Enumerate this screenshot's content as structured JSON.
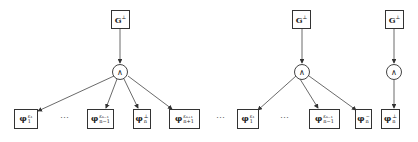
{
  "diagrams": [
    {
      "root": {
        "base": "G",
        "sup": "⊥"
      },
      "op": "∧",
      "children": [
        {
          "base": "φ",
          "sub": "1",
          "sup": "ε₁"
        },
        {
          "ellipsis": "⋯"
        },
        {
          "base": "φ",
          "sub": "n−1",
          "sup": "ε_{n−1}"
        },
        {
          "base": "φ",
          "sub": "n",
          "sup": "⊥"
        },
        {
          "base": "φ",
          "sub": "n+1",
          "sup": "ε_{n+1}"
        }
      ]
    },
    {
      "root": {
        "base": "G",
        "sup": "⊥"
      },
      "op": "∧",
      "children": [
        {
          "ellipsis": "⋯"
        },
        {
          "base": "φ",
          "sub": "1",
          "sup": "ε₁"
        },
        {
          "ellipsis": "⋯"
        },
        {
          "base": "φ",
          "sub": "n−1",
          "sup": "ε_{n−1}"
        },
        {
          "base": "φ",
          "sub": "n",
          "sup": "~"
        }
      ]
    },
    {
      "root": {
        "base": "G",
        "sup": "⊥"
      },
      "op": "∧",
      "children": [
        {
          "base": "φ",
          "sub": "n",
          "sup": "⊥"
        }
      ]
    }
  ],
  "labels": {
    "G_root": "G",
    "perp": "⊥",
    "wedge": "∧",
    "phi": "φ",
    "dots": "⋯",
    "s1": "1",
    "e1": "ε₁",
    "snm1": "n−1",
    "enm1": "εₙ₋₁",
    "sn": "n",
    "snp1": "n+1",
    "enp1": "εₙ₊₁",
    "tilde": "~"
  }
}
